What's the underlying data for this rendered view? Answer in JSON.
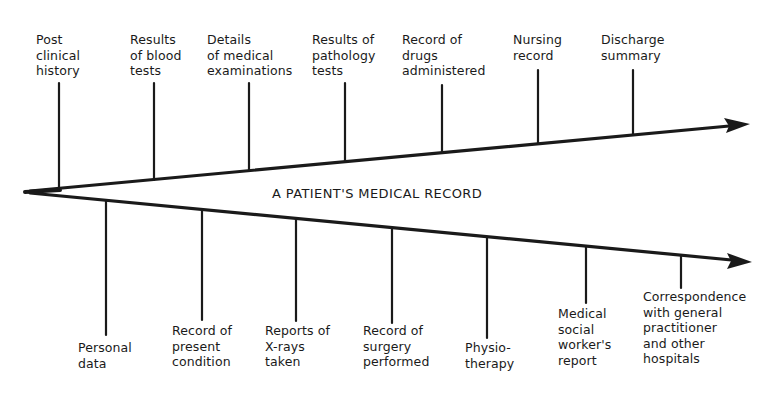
{
  "title": "A PATIENT'S MEDICAL RECORD",
  "colors": {
    "ink": "#1a1a1a",
    "background": "#ffffff"
  },
  "upper_branch": {
    "items": [
      {
        "label": "Post\nclinical\nhistory"
      },
      {
        "label": "Results\nof blood\ntests"
      },
      {
        "label": "Details\nof medical\nexaminations"
      },
      {
        "label": "Results of\npathology\ntests"
      },
      {
        "label": "Record of\ndrugs\nadministered"
      },
      {
        "label": "Nursing\nrecord"
      },
      {
        "label": "Discharge\nsummary"
      }
    ]
  },
  "lower_branch": {
    "items": [
      {
        "label": "Personal\ndata"
      },
      {
        "label": "Record of\npresent\ncondition"
      },
      {
        "label": "Reports of\nX-rays\ntaken"
      },
      {
        "label": "Record of\nsurgery\nperformed"
      },
      {
        "label": "Physio-\ntherapy"
      },
      {
        "label": "Medical\nsocial\nworker's\nreport"
      },
      {
        "label": "Correspondence\nwith general\npractitioner\nand other\nhospitals"
      }
    ]
  }
}
